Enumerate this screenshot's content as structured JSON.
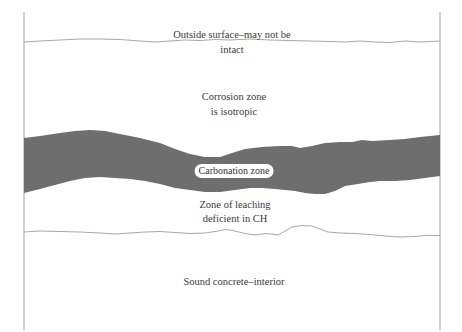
{
  "diagram": {
    "labels": {
      "outside_surface_line1": "Outside surface–may not be",
      "outside_surface_line2": "intact",
      "corrosion_line1": "Corrosion zone",
      "corrosion_line2": "is isotropic",
      "carbonation": "Carbonation zone",
      "leaching_line1": "Zone of leaching",
      "leaching_line2": "deficient in CH",
      "sound_concrete": "Sound concrete–interior"
    },
    "colors": {
      "carbonation_band": "#6e6e6e",
      "boundary_lines": "#9a9a9a",
      "text": "#3a3a3a",
      "background": "#ffffff"
    }
  }
}
